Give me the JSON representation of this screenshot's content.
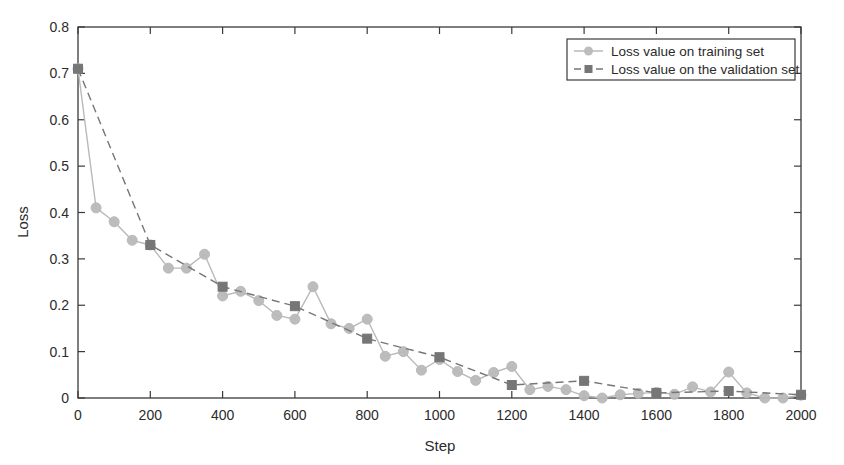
{
  "chart_data": {
    "type": "line",
    "title": "",
    "xlabel": "Step",
    "ylabel": "Loss",
    "xlim": [
      0,
      2000
    ],
    "ylim": [
      0,
      0.8
    ],
    "xticks": [
      0,
      200,
      400,
      600,
      800,
      1000,
      1200,
      1400,
      1600,
      1800,
      2000
    ],
    "xticklabels": [
      "0",
      "200",
      "400",
      "600",
      "800",
      "1000",
      "1200",
      "1400",
      "1600",
      "1800",
      "2000"
    ],
    "yticks": [
      0,
      0.1,
      0.2,
      0.3,
      0.4,
      0.5,
      0.6,
      0.7,
      0.8
    ],
    "yticklabels": [
      "0",
      "0.1",
      "0.2",
      "0.3",
      "0.4",
      "0.5",
      "0.6",
      "0.7",
      "0.8"
    ],
    "grid": false,
    "legend_position": "top-right",
    "series": [
      {
        "name": "Loss value on training set",
        "color": "#b9b9b9",
        "marker": "circle",
        "linestyle": "solid",
        "x": [
          0,
          50,
          100,
          150,
          200,
          250,
          300,
          350,
          400,
          450,
          500,
          550,
          600,
          650,
          700,
          750,
          800,
          850,
          900,
          950,
          1000,
          1050,
          1100,
          1150,
          1200,
          1250,
          1300,
          1350,
          1400,
          1450,
          1500,
          1550,
          1600,
          1650,
          1700,
          1750,
          1800,
          1850,
          1900,
          1950,
          2000
        ],
        "values": [
          0.71,
          0.41,
          0.38,
          0.34,
          0.33,
          0.28,
          0.28,
          0.31,
          0.22,
          0.23,
          0.21,
          0.178,
          0.17,
          0.24,
          0.16,
          0.15,
          0.17,
          0.09,
          0.1,
          0.06,
          0.083,
          0.057,
          0.038,
          0.055,
          0.068,
          0.018,
          0.025,
          0.018,
          0.005,
          0.0,
          0.007,
          0.01,
          0.012,
          0.008,
          0.024,
          0.013,
          0.056,
          0.011,
          0.0,
          0.0,
          0.006
        ]
      },
      {
        "name": "Loss value on the validation set",
        "color": "#767676",
        "marker": "square",
        "linestyle": "dashed",
        "x": [
          0,
          200,
          400,
          600,
          800,
          1000,
          1200,
          1400,
          1600,
          1800,
          2000
        ],
        "values": [
          0.71,
          0.33,
          0.24,
          0.198,
          0.128,
          0.088,
          0.028,
          0.037,
          0.011,
          0.015,
          0.007
        ]
      }
    ]
  },
  "legend": {
    "entries": [
      {
        "label": "Loss value on training set"
      },
      {
        "label": "Loss value on the validation set"
      }
    ]
  },
  "axes": {
    "x_title": "Step",
    "y_title": "Loss"
  }
}
